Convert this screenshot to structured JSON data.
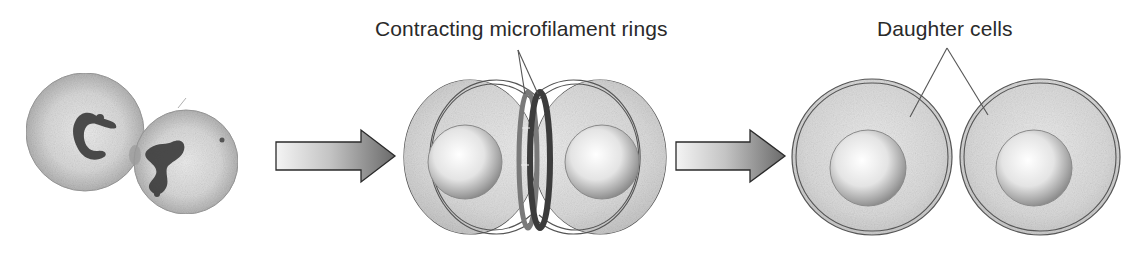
{
  "diagram": {
    "stages": [
      {
        "id": "micrograph",
        "description": "Micrograph of a dividing cell with two condensed chromatin masses"
      },
      {
        "id": "contracting",
        "description": "Dividing cell pinched by contracting microfilament rings"
      },
      {
        "id": "daughters",
        "description": "Two separated daughter cells"
      }
    ],
    "labels": {
      "rings": "Contracting microfilament rings",
      "daughters": "Daughter cells"
    },
    "arrows": [
      {
        "from": "micrograph",
        "to": "contracting"
      },
      {
        "from": "contracting",
        "to": "daughters"
      }
    ],
    "colors": {
      "cell_fill": "#d9d9d9",
      "cell_outline": "#555555",
      "ring_dark": "#3c3c3c",
      "ring_light": "#7a7a7a",
      "chromatin": "#3a3a3a",
      "arrow_dark": "#6a6a6a",
      "arrow_light": "#f2f2f2",
      "leader_line": "#555555"
    }
  }
}
